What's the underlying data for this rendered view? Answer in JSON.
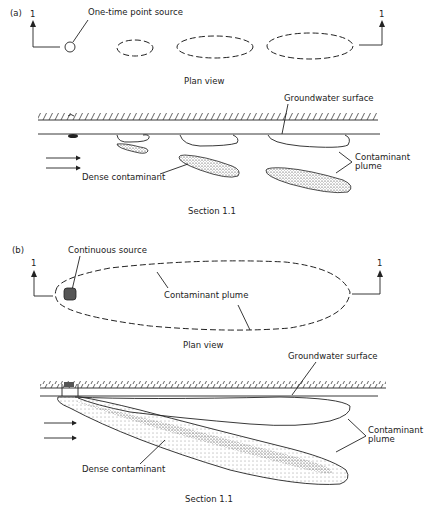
{
  "panel_a": {
    "label": "(a)",
    "section_marker": "1",
    "source_label": "One-time point source",
    "plan_view_label": "Plan view",
    "groundwater_label": "Groundwater surface",
    "dense_label": "Dense contaminant",
    "plume_label_line1": "Contaminant",
    "plume_label_line2": "plume",
    "section_label": "Section 1.1"
  },
  "panel_b": {
    "label": "(b)",
    "section_marker": "1",
    "source_label": "Continuous source",
    "plume_plan_label": "Contaminant plume",
    "plan_view_label": "Plan view",
    "groundwater_label": "Groundwater surface",
    "dense_label": "Dense contaminant",
    "plume_label_line1": "Contaminant",
    "plume_label_line2": "plume",
    "section_label": "Section 1.1"
  },
  "colors": {
    "ink": "#222222",
    "source_fill": "#555555",
    "background": "#ffffff"
  }
}
